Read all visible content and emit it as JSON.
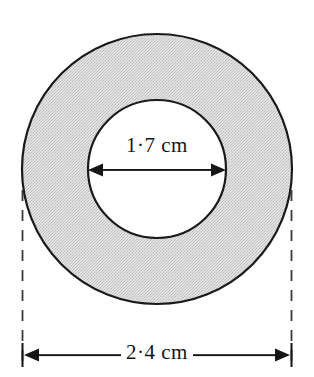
{
  "figure": {
    "type": "geometry-diagram",
    "background_color": "#ffffff",
    "shape": {
      "name": "annulus",
      "fill_color": "#d9d9d9",
      "stroke_color": "#1a1a1a",
      "outer_circle": {
        "center_x": 157,
        "center_y": 169,
        "radius": 135
      },
      "inner_circle": {
        "center_x": 157,
        "center_y": 169,
        "radius": 69
      }
    },
    "dimensions": {
      "inner_diameter": {
        "label": "1·7 cm",
        "value": "1·7",
        "unit": "cm",
        "arrow_style": "double-headed",
        "y": 170,
        "x_start": 88,
        "x_end": 226
      },
      "outer_diameter": {
        "label": "2·4 cm",
        "value": "2·4",
        "unit": "cm",
        "arrow_style": "double-headed",
        "y": 355,
        "x_start": 22,
        "x_end": 292
      }
    },
    "extension_lines": {
      "style": "dashed",
      "color": "#3a3a3a",
      "left_x": 22,
      "right_x": 292,
      "y_top": 190,
      "y_bottom": 362
    }
  }
}
